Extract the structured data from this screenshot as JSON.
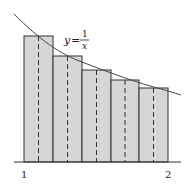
{
  "diagram": {
    "type": "midpoint-rule-riemann-sum",
    "function_label": {
      "y": "y",
      "eq": "=",
      "num": "1",
      "den": "x"
    },
    "function": "y = 1/x",
    "interval": [
      1,
      2
    ],
    "n_rectangles": 5,
    "x_tick_labels": [
      "1",
      "2"
    ],
    "rectangles": [
      {
        "x_left": 1.0,
        "x_right": 1.2,
        "midpoint": 1.1,
        "height": 0.909
      },
      {
        "x_left": 1.2,
        "x_right": 1.4,
        "midpoint": 1.3,
        "height": 0.769
      },
      {
        "x_left": 1.4,
        "x_right": 1.6,
        "midpoint": 1.5,
        "height": 0.667
      },
      {
        "x_left": 1.6,
        "x_right": 1.8,
        "midpoint": 1.7,
        "height": 0.588
      },
      {
        "x_left": 1.8,
        "x_right": 2.0,
        "midpoint": 1.9,
        "height": 0.526
      }
    ],
    "colors": {
      "rect_fill": "#d6d6d6",
      "rect_stroke": "#333333",
      "curve": "#444444",
      "axis": "#333333",
      "dashed": "#333333"
    }
  }
}
